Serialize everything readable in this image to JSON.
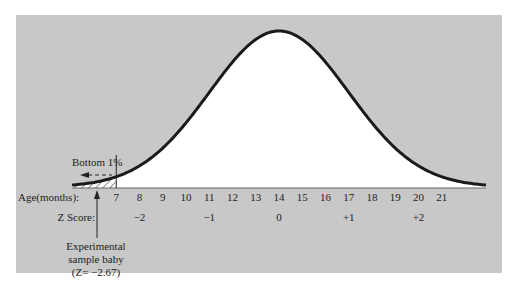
{
  "figure": {
    "background_color": "#c8c8c8",
    "curve_fill": "#ffffff",
    "curve_stroke": "#1a1a1a",
    "bottom_label": "Bottom 1%",
    "age_axis_label": "Age(months):",
    "z_axis_label": "Z Score:",
    "annotation": {
      "line1": "Experimental",
      "line2": "sample baby",
      "line3": "(Z= −2.67)"
    }
  },
  "chart_data": {
    "type": "area",
    "title": "",
    "distribution": {
      "mean": 14,
      "sd": 3
    },
    "x_axis": {
      "label": "Age(months):",
      "ticks": [
        7,
        8,
        9,
        10,
        11,
        12,
        13,
        14,
        15,
        16,
        17,
        18,
        19,
        20,
        21
      ]
    },
    "z_axis": {
      "label": "Z Score:",
      "ticks": [
        {
          "age": 8,
          "z": "−2"
        },
        {
          "age": 11,
          "z": "−1"
        },
        {
          "age": 14,
          "z": "0"
        },
        {
          "age": 17,
          "z": "+1"
        },
        {
          "age": 20,
          "z": "+2"
        }
      ]
    },
    "shaded_region": {
      "label": "Bottom 1%",
      "to_age": 7,
      "pattern": "hatched"
    },
    "annotations": [
      {
        "text": "Experimental sample baby (Z= −2.67)",
        "arrow_to_age": 6
      }
    ],
    "grid": false
  }
}
